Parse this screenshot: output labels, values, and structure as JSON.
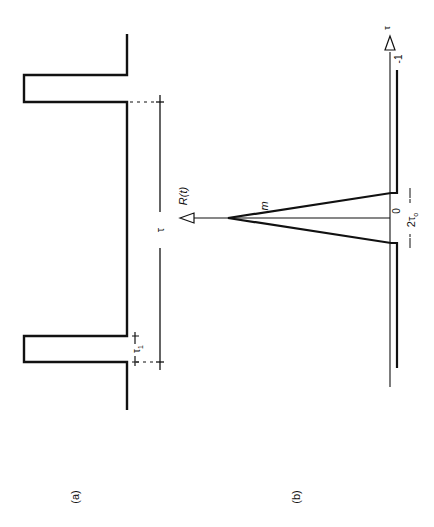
{
  "figure": {
    "orientation": "rotated 90 degrees counter-clockwise",
    "ink_color": "#111111",
    "background": "#ffffff",
    "panel_a": {
      "label": "(a)",
      "description": "periodic rectangular pulse train",
      "pulse_width_label": "τ",
      "pulse_width_subscript": "1",
      "period_label": "τ"
    },
    "panel_b": {
      "label": "(b)",
      "description": "autocorrelation function",
      "axis_label": "R(t)",
      "horizontal_axis_label": "τ",
      "peak_label": "m",
      "origin_label": "0",
      "baseline_label": "-1",
      "base_width_label": "2τ",
      "base_width_subscript": "o"
    }
  }
}
